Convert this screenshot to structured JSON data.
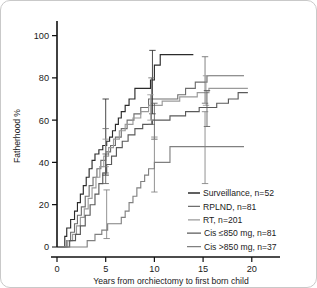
{
  "figure": {
    "background": "#ffffff",
    "border_color": "#c9c9c9"
  },
  "axes": {
    "x": {
      "label": "Years from orchiectomy to first born child",
      "ticks": [
        "0",
        "5",
        "10",
        "15",
        "20"
      ],
      "lim": [
        0,
        23
      ]
    },
    "y": {
      "label": "Fatherhood %",
      "ticks": [
        "0",
        "20",
        "40",
        "60",
        "80",
        "100"
      ],
      "lim": [
        0,
        105
      ]
    }
  },
  "legend": {
    "position": "bottom-right",
    "items": [
      {
        "label": "Surveillance, n=52",
        "color": "#2b2b2b"
      },
      {
        "label": "RPLND, n=81",
        "color": "#6e6e6e"
      },
      {
        "label": "RT, n=201",
        "color": "#9a9a9a"
      },
      {
        "label": "Cis  ≤850 mg, n=81",
        "color": "#5a5a5a"
      },
      {
        "label": "Cis  >850 mg, n=37",
        "color": "#808080"
      }
    ]
  },
  "chart_data": {
    "type": "line",
    "title": "",
    "xlabel": "Years from orchiectomy to first born child",
    "ylabel": "Fatherhood %",
    "xlim": [
      0,
      23
    ],
    "ylim": [
      0,
      105
    ],
    "xticks": [
      0,
      5,
      10,
      15,
      20
    ],
    "yticks": [
      0,
      20,
      40,
      60,
      80,
      100
    ],
    "grid": false,
    "step_style": "post",
    "legend_position": "bottom-right",
    "series": [
      {
        "name": "Surveillance, n=52",
        "n": 52,
        "color": "#2b2b2b",
        "points": [
          [
            0.0,
            0
          ],
          [
            0.8,
            0
          ],
          [
            0.8,
            5
          ],
          [
            1.0,
            5
          ],
          [
            1.0,
            9
          ],
          [
            1.4,
            9
          ],
          [
            1.4,
            13
          ],
          [
            1.8,
            13
          ],
          [
            1.8,
            17
          ],
          [
            2.1,
            17
          ],
          [
            2.1,
            21
          ],
          [
            2.4,
            21
          ],
          [
            2.4,
            25
          ],
          [
            2.7,
            25
          ],
          [
            2.7,
            29
          ],
          [
            3.0,
            29
          ],
          [
            3.0,
            33
          ],
          [
            3.3,
            33
          ],
          [
            3.3,
            37
          ],
          [
            3.6,
            37
          ],
          [
            3.6,
            41
          ],
          [
            3.9,
            41
          ],
          [
            3.9,
            44
          ],
          [
            4.3,
            44
          ],
          [
            4.3,
            46
          ],
          [
            4.7,
            46
          ],
          [
            4.7,
            48
          ],
          [
            5.1,
            48
          ],
          [
            5.1,
            50
          ],
          [
            5.4,
            50
          ],
          [
            5.4,
            52
          ],
          [
            5.7,
            52
          ],
          [
            5.7,
            55
          ],
          [
            6.0,
            55
          ],
          [
            6.0,
            58
          ],
          [
            6.3,
            58
          ],
          [
            6.3,
            61
          ],
          [
            6.6,
            61
          ],
          [
            6.6,
            64
          ],
          [
            7.0,
            64
          ],
          [
            7.0,
            67
          ],
          [
            7.4,
            67
          ],
          [
            7.4,
            70
          ],
          [
            8.0,
            70
          ],
          [
            8.0,
            75
          ],
          [
            9.6,
            75
          ],
          [
            9.6,
            79
          ],
          [
            10.0,
            79
          ],
          [
            10.0,
            86
          ],
          [
            10.6,
            86
          ],
          [
            10.6,
            91
          ],
          [
            14.0,
            91
          ]
        ],
        "error_bars": [
          {
            "x": 5.0,
            "y": 48,
            "low": 34,
            "high": 70
          },
          {
            "x": 9.8,
            "y": 77,
            "low": 63,
            "high": 93
          }
        ]
      },
      {
        "name": "RPLND, n=81",
        "n": 81,
        "color": "#6e6e6e",
        "points": [
          [
            0.0,
            0
          ],
          [
            1.0,
            0
          ],
          [
            1.0,
            3
          ],
          [
            1.4,
            3
          ],
          [
            1.4,
            7
          ],
          [
            1.8,
            7
          ],
          [
            1.8,
            11
          ],
          [
            2.1,
            11
          ],
          [
            2.1,
            15
          ],
          [
            2.5,
            15
          ],
          [
            2.5,
            19
          ],
          [
            2.9,
            19
          ],
          [
            2.9,
            24
          ],
          [
            3.3,
            24
          ],
          [
            3.3,
            29
          ],
          [
            3.7,
            29
          ],
          [
            3.7,
            33
          ],
          [
            4.1,
            33
          ],
          [
            4.1,
            37
          ],
          [
            4.5,
            37
          ],
          [
            4.5,
            41
          ],
          [
            5.0,
            41
          ],
          [
            5.0,
            45
          ],
          [
            5.5,
            45
          ],
          [
            5.5,
            48
          ],
          [
            6.0,
            48
          ],
          [
            6.0,
            52
          ],
          [
            6.6,
            52
          ],
          [
            6.6,
            56
          ],
          [
            7.2,
            56
          ],
          [
            7.2,
            60
          ],
          [
            7.9,
            60
          ],
          [
            7.9,
            63
          ],
          [
            8.6,
            63
          ],
          [
            8.6,
            66
          ],
          [
            9.4,
            66
          ],
          [
            9.4,
            70
          ],
          [
            12.4,
            70
          ],
          [
            12.4,
            72
          ],
          [
            13.2,
            72
          ],
          [
            13.2,
            75
          ],
          [
            14.2,
            75
          ],
          [
            14.2,
            78
          ],
          [
            15.4,
            78
          ],
          [
            15.4,
            81
          ],
          [
            19.2,
            81
          ]
        ],
        "error_bars": [
          {
            "x": 5.0,
            "y": 45,
            "low": 35,
            "high": 56
          },
          {
            "x": 9.7,
            "y": 69,
            "low": 58,
            "high": 80
          },
          {
            "x": 15.2,
            "y": 79,
            "low": 68,
            "high": 90
          }
        ]
      },
      {
        "name": "RT, n=201",
        "n": 201,
        "color": "#9a9a9a",
        "points": [
          [
            0.0,
            0
          ],
          [
            1.1,
            0
          ],
          [
            1.1,
            3
          ],
          [
            1.6,
            3
          ],
          [
            1.6,
            6
          ],
          [
            2.0,
            6
          ],
          [
            2.0,
            10
          ],
          [
            2.4,
            10
          ],
          [
            2.4,
            14
          ],
          [
            2.8,
            14
          ],
          [
            2.8,
            18
          ],
          [
            3.2,
            18
          ],
          [
            3.2,
            23
          ],
          [
            3.6,
            23
          ],
          [
            3.6,
            28
          ],
          [
            4.0,
            28
          ],
          [
            4.0,
            33
          ],
          [
            4.4,
            33
          ],
          [
            4.4,
            38
          ],
          [
            4.8,
            38
          ],
          [
            4.8,
            43
          ],
          [
            5.3,
            43
          ],
          [
            5.3,
            47
          ],
          [
            5.8,
            47
          ],
          [
            5.8,
            51
          ],
          [
            6.4,
            51
          ],
          [
            6.4,
            55
          ],
          [
            7.0,
            55
          ],
          [
            7.0,
            58
          ],
          [
            7.8,
            58
          ],
          [
            7.8,
            61
          ],
          [
            8.6,
            61
          ],
          [
            8.6,
            64
          ],
          [
            9.4,
            64
          ],
          [
            9.4,
            67
          ],
          [
            10.8,
            67
          ],
          [
            10.8,
            69
          ],
          [
            12.6,
            69
          ],
          [
            12.6,
            71
          ],
          [
            14.4,
            71
          ],
          [
            14.4,
            73
          ],
          [
            15.6,
            73
          ],
          [
            15.6,
            75
          ],
          [
            19.6,
            75
          ]
        ],
        "error_bars": [
          {
            "x": 5.0,
            "y": 44,
            "low": 38,
            "high": 51
          },
          {
            "x": 9.6,
            "y": 66,
            "low": 60,
            "high": 72
          },
          {
            "x": 15.3,
            "y": 74,
            "low": 67,
            "high": 81
          }
        ]
      },
      {
        "name": "Cis  ≤850 mg, n=81",
        "n": 81,
        "color": "#5a5a5a",
        "points": [
          [
            0.0,
            0
          ],
          [
            1.3,
            0
          ],
          [
            1.3,
            3
          ],
          [
            1.9,
            3
          ],
          [
            1.9,
            6
          ],
          [
            2.4,
            6
          ],
          [
            2.4,
            10
          ],
          [
            2.9,
            10
          ],
          [
            2.9,
            15
          ],
          [
            3.4,
            15
          ],
          [
            3.4,
            20
          ],
          [
            3.9,
            20
          ],
          [
            3.9,
            25
          ],
          [
            4.3,
            25
          ],
          [
            4.3,
            30
          ],
          [
            4.7,
            30
          ],
          [
            4.7,
            35
          ],
          [
            5.1,
            35
          ],
          [
            5.1,
            39
          ],
          [
            5.6,
            39
          ],
          [
            5.6,
            43
          ],
          [
            6.1,
            43
          ],
          [
            6.1,
            47
          ],
          [
            6.7,
            47
          ],
          [
            6.7,
            50
          ],
          [
            7.3,
            50
          ],
          [
            7.3,
            53
          ],
          [
            8.0,
            53
          ],
          [
            8.0,
            56
          ],
          [
            8.8,
            56
          ],
          [
            8.8,
            58
          ],
          [
            9.8,
            58
          ],
          [
            9.8,
            60
          ],
          [
            11.6,
            60
          ],
          [
            11.6,
            62
          ],
          [
            13.2,
            62
          ],
          [
            13.2,
            64
          ],
          [
            14.6,
            64
          ],
          [
            14.6,
            66
          ],
          [
            16.4,
            66
          ],
          [
            16.4,
            68
          ],
          [
            17.6,
            68
          ],
          [
            17.6,
            70
          ],
          [
            18.6,
            70
          ],
          [
            18.6,
            73
          ],
          [
            19.6,
            73
          ]
        ],
        "error_bars": [
          {
            "x": 5.0,
            "y": 36,
            "low": 30,
            "high": 44
          },
          {
            "x": 10.0,
            "y": 59,
            "low": 51,
            "high": 68
          },
          {
            "x": 15.4,
            "y": 65,
            "low": 57,
            "high": 74
          }
        ]
      },
      {
        "name": "Cis  >850 mg, n=37",
        "n": 37,
        "color": "#808080",
        "points": [
          [
            0.0,
            0
          ],
          [
            3.1,
            0
          ],
          [
            3.1,
            3
          ],
          [
            3.9,
            3
          ],
          [
            3.9,
            6
          ],
          [
            4.6,
            6
          ],
          [
            4.6,
            8
          ],
          [
            5.2,
            8
          ],
          [
            5.2,
            11
          ],
          [
            6.6,
            11
          ],
          [
            6.6,
            14
          ],
          [
            7.0,
            14
          ],
          [
            7.0,
            17
          ],
          [
            7.4,
            17
          ],
          [
            7.4,
            21
          ],
          [
            7.8,
            21
          ],
          [
            7.8,
            24
          ],
          [
            8.2,
            24
          ],
          [
            8.2,
            28
          ],
          [
            8.6,
            28
          ],
          [
            8.6,
            31
          ],
          [
            9.0,
            31
          ],
          [
            9.0,
            34
          ],
          [
            9.4,
            34
          ],
          [
            9.4,
            37
          ],
          [
            10.0,
            37
          ],
          [
            10.0,
            40
          ],
          [
            11.6,
            40
          ],
          [
            11.6,
            47.5
          ],
          [
            19.2,
            47.5
          ]
        ],
        "error_bars": [
          {
            "x": 5.1,
            "y": 10,
            "low": 4,
            "high": 27
          },
          {
            "x": 10.0,
            "y": 39,
            "low": 26,
            "high": 52
          },
          {
            "x": 15.2,
            "y": 47.5,
            "low": 30,
            "high": 64
          }
        ]
      }
    ]
  }
}
